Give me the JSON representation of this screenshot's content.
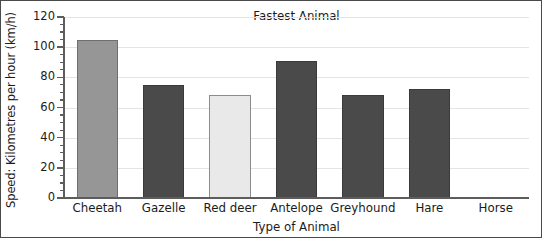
{
  "chart_data": {
    "type": "bar",
    "title": "Fastest Animal",
    "xlabel": "Type of Animal",
    "ylabel": "Speed: Kilometres per hour (km/h)",
    "categories": [
      "Cheetah",
      "Gazelle",
      "Red deer",
      "Antelope",
      "Greyhound",
      "Hare",
      "Horse"
    ],
    "values": [
      105,
      75,
      68,
      91,
      68,
      72,
      null
    ],
    "bar_colors": [
      "#969696",
      "#4a4a4a",
      "#e9e9e9",
      "#4a4a4a",
      "#4a4a4a",
      "#4a4a4a",
      "#ffffff"
    ],
    "bar_edge_colors": [
      "#6f6f6f",
      "#3a3a3a",
      "#8c8c8c",
      "#3a3a3a",
      "#3a3a3a",
      "#3a3a3a",
      "#ffffff"
    ],
    "ylim": [
      0,
      120
    ],
    "ytick_labels": [
      "0",
      "20",
      "40",
      "60",
      "80",
      "100",
      "120"
    ],
    "ytick_values": [
      0,
      20,
      40,
      60,
      80,
      100,
      120
    ],
    "minor_tick_step": 5,
    "grid": true,
    "grid_color": "#e4e4e4",
    "legend": null,
    "axis_color": "#5d5d5d",
    "text_color": "#1b1b1b",
    "background": "#ffffff",
    "missing_note": "Horse has no bar drawn"
  }
}
